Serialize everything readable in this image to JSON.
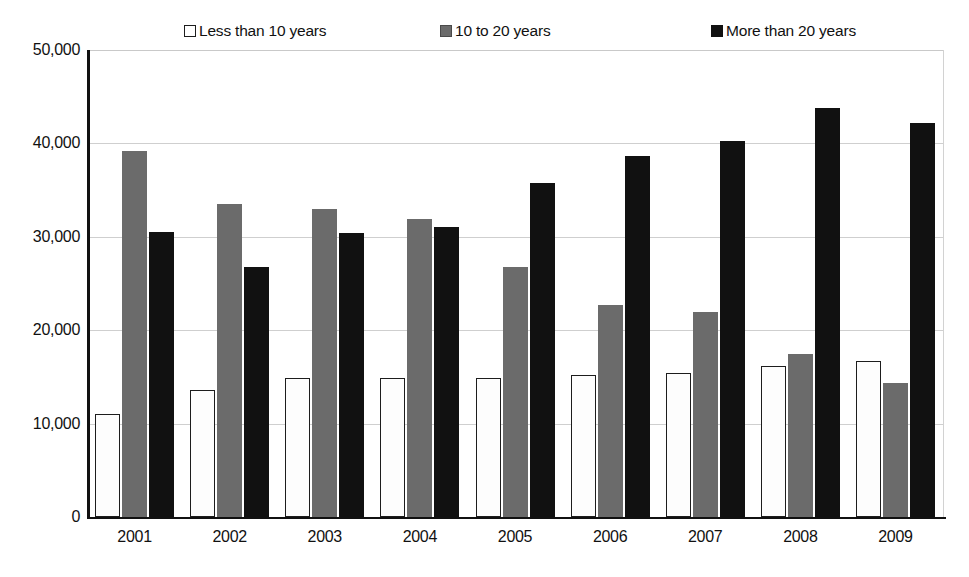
{
  "chart_data": {
    "type": "bar",
    "title": "",
    "xlabel": "",
    "ylabel": "",
    "categories": [
      "2001",
      "2002",
      "2003",
      "2004",
      "2005",
      "2006",
      "2007",
      "2008",
      "2009"
    ],
    "series": [
      {
        "name": "Less than 10 years",
        "color": "#ffffff",
        "marker": "white-square-outlined",
        "values": [
          11000,
          13600,
          14900,
          14900,
          14900,
          15200,
          15400,
          16200,
          16700
        ]
      },
      {
        "name": "10 to 20 years",
        "color": "#6b6b6b",
        "marker": "gray-square",
        "values": [
          39200,
          33500,
          33000,
          31900,
          26800,
          22700,
          22000,
          17400,
          14300
        ]
      },
      {
        "name": "More than 20 years",
        "color": "#111111",
        "marker": "black-square",
        "values": [
          30500,
          26800,
          30400,
          31000,
          35800,
          38700,
          40300,
          43800,
          42200
        ]
      }
    ],
    "ylim": [
      0,
      50000
    ],
    "ytick_values": [
      0,
      10000,
      20000,
      30000,
      40000,
      50000
    ],
    "ytick_labels": [
      "0",
      "10,000",
      "20,000",
      "30,000",
      "40,000",
      "50,000"
    ],
    "grid": true,
    "legend_position": "top"
  },
  "legend": {
    "entries": [
      {
        "label": "Less than 10 years"
      },
      {
        "label": "10 to 20 years"
      },
      {
        "label": "More than 20 years"
      }
    ]
  }
}
